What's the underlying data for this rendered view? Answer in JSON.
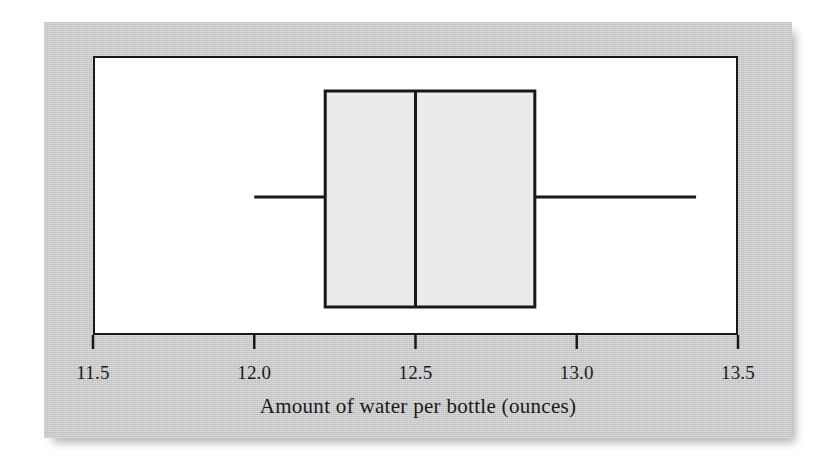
{
  "figure": {
    "panel_background": "#c9c9c9",
    "plot_background": "#ffffff",
    "frame_color": "#16181a"
  },
  "chart_data": {
    "type": "box",
    "title": "",
    "xlabel": "Amount of water per bottle (ounces)",
    "ylabel": "",
    "xlim": [
      11.5,
      13.5
    ],
    "grid": false,
    "legend": null,
    "orientation": "horizontal",
    "tick_labels": [
      "11.5",
      "12.0",
      "12.5",
      "13.0",
      "13.5"
    ],
    "tick_values": [
      11.5,
      12.0,
      12.5,
      13.0,
      13.5
    ],
    "boxes": [
      {
        "name": "Amount of water per bottle",
        "min": 12.0,
        "q1": 12.22,
        "median": 12.5,
        "q3": 12.87,
        "max": 13.37,
        "outliers": [],
        "box_fill": "#ebebeb",
        "line_color": "#16181a"
      }
    ]
  },
  "axis": {
    "label": "Amount of water per bottle (ounces)",
    "ticks": [
      {
        "label": "11.5",
        "value": 11.5
      },
      {
        "label": "12.0",
        "value": 12.0
      },
      {
        "label": "12.5",
        "value": 12.5
      },
      {
        "label": "13.0",
        "value": 13.0
      },
      {
        "label": "13.5",
        "value": 13.5
      }
    ]
  }
}
